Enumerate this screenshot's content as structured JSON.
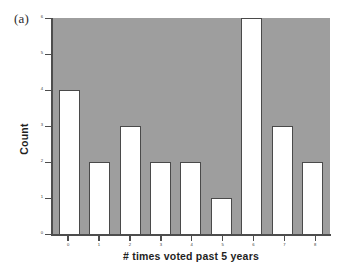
{
  "figure": {
    "panel_label": "(a)",
    "background_color": "#ffffff",
    "plot_background_color": "#9e9e9e",
    "bar_fill_color": "#ffffff",
    "bar_edge_color": "#4a4a4a",
    "axis_color": "#4d4d4d"
  },
  "chart_data": {
    "type": "bar",
    "title": "",
    "subtitle": "",
    "xlabel": "# times voted past 5 years",
    "ylabel": "Count",
    "categories": [
      "0",
      "1",
      "2",
      "3",
      "4",
      "5",
      "6",
      "7",
      "8"
    ],
    "values": [
      4,
      2,
      3,
      2,
      2,
      1,
      6,
      3,
      2
    ],
    "ylim": [
      0,
      6
    ],
    "yticks": [
      "0",
      "1",
      "2",
      "3",
      "4",
      "5",
      "6"
    ],
    "ytick_values": [
      0,
      1,
      2,
      3,
      4,
      5,
      6
    ],
    "xticks": [
      "0",
      "1",
      "2",
      "3",
      "4",
      "5",
      "6",
      "7",
      "8"
    ],
    "grid": false,
    "legend": null,
    "legend_position": "none",
    "annotations": [
      "(a)"
    ]
  }
}
